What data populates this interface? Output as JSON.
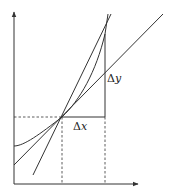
{
  "diagram": {
    "labels": {
      "delta_x": {
        "symbol": "Δ",
        "var": "x"
      },
      "delta_y": {
        "symbol": "Δ",
        "var": "y"
      }
    },
    "colors": {
      "stroke": "#333333",
      "background": "#ffffff"
    },
    "elements": {
      "x_axis": "horizontal axis with arrow",
      "y_axis": "vertical axis with arrow",
      "curve": "convex curve",
      "tangent_line": "tangent at point P",
      "secant_line": "secant through P and Q",
      "delta_x_segment": "horizontal increment",
      "delta_y_segment": "vertical increment",
      "guides": "dashed projection lines"
    }
  }
}
